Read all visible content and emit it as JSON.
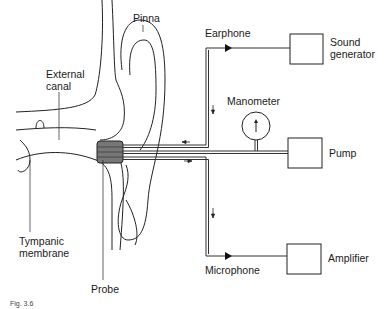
{
  "diagram": {
    "labels": {
      "pinna": "Pinna",
      "external_canal_line1": "External",
      "external_canal_line2": "canal",
      "tympanic_line1": "Tympanic",
      "tympanic_line2": "membrane",
      "probe": "Probe",
      "earphone": "Earphone",
      "manometer": "Manometer",
      "microphone": "Microphone",
      "sound_generator_line1": "Sound",
      "sound_generator_line2": "generator",
      "pump": "Pump",
      "amplifier": "Amplifier"
    },
    "caption": "Fig. 3.6"
  }
}
